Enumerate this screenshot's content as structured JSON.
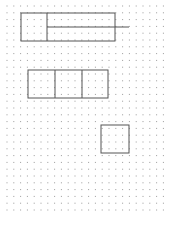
{
  "grid": {
    "spacing": 6.8,
    "origin_x": 7,
    "origin_y": 6,
    "cols": 24,
    "rows": 31,
    "dot_color": "#9a9a9a"
  },
  "line_color": "#555555",
  "shapes": [
    {
      "name": "top-rectangle",
      "x": 21,
      "y": 13,
      "w": 94,
      "h": 28
    },
    {
      "name": "top-divider",
      "type": "line",
      "x1": 47,
      "y1": 13,
      "x2": 47,
      "y2": 41
    },
    {
      "name": "top-extension-line",
      "type": "line",
      "x1": 47,
      "y1": 27,
      "x2": 129,
      "y2": 27
    },
    {
      "name": "middle-rectangle",
      "x": 28,
      "y": 70,
      "w": 80,
      "h": 28
    },
    {
      "name": "middle-divider-1",
      "type": "line",
      "x1": 55,
      "y1": 70,
      "x2": 55,
      "y2": 98
    },
    {
      "name": "middle-divider-2",
      "type": "line",
      "x1": 82,
      "y1": 70,
      "x2": 82,
      "y2": 98
    },
    {
      "name": "bottom-square",
      "x": 101,
      "y": 125,
      "w": 28,
      "h": 28
    }
  ]
}
